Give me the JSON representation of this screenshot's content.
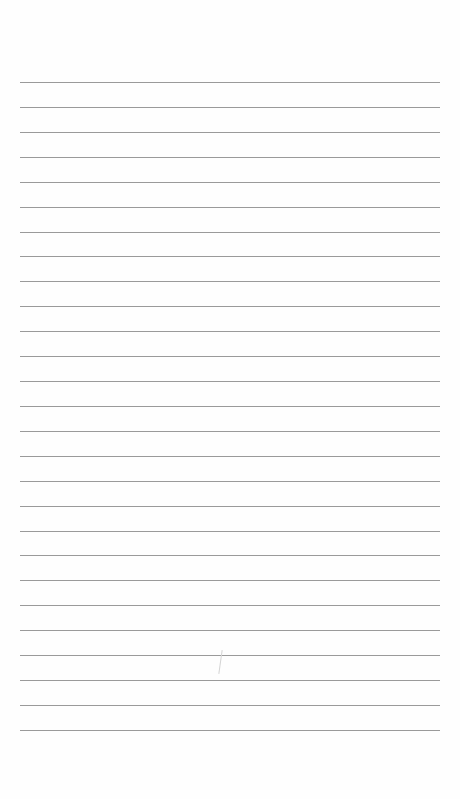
{
  "page": {
    "type": "lined-paper",
    "background": "#fefefe",
    "line_color": "#9a9a9a",
    "line_count": 27,
    "first_line_y": 82,
    "line_spacing": 24.92,
    "line_left": 20,
    "line_width": 420
  },
  "marks": [
    {
      "name": "faint-pencil-mark",
      "x": 220,
      "y": 650,
      "height": 24,
      "color": "#d4d4d4"
    }
  ]
}
